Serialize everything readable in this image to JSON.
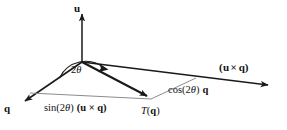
{
  "figure": {
    "background_color": "#ffffff",
    "stroke_color": "#1a1a1a",
    "construction_line_color": "#8c8c8c",
    "labels": {
      "u_axis": "u",
      "q_axis": "q",
      "u_cross_q_axis": "(u × q)",
      "angle": "2θ",
      "sin_component": "sin(2θ) (u × q)",
      "cos_component": "cos(2θ) q",
      "image_vector": "T(q)"
    },
    "label_parts": {
      "sin_fn": "sin(2",
      "sin_theta": "θ",
      "sin_close": ")",
      "sin_vector": "(u × q)",
      "cos_fn": "cos(2",
      "cos_theta": "θ",
      "cos_close": ")",
      "cos_vector": "q",
      "angle_num": "2",
      "angle_theta": "θ",
      "tq_t": "T",
      "tq_open": "(",
      "tq_q": "q",
      "tq_close": ")",
      "ucq_open": "(",
      "ucq_u": "u",
      "ucq_times": "×",
      "ucq_q": "q",
      "ucq_close": ")"
    },
    "geometry": {
      "origin": [
        82,
        62
      ],
      "u_tip": [
        82,
        10
      ],
      "q_tip": [
        21,
        104
      ],
      "u_cross_q_tip": [
        273,
        86
      ],
      "tq_tip": [
        151,
        99
      ],
      "sin_foot": [
        30,
        93
      ],
      "cos_foot": [
        196,
        78
      ]
    }
  }
}
